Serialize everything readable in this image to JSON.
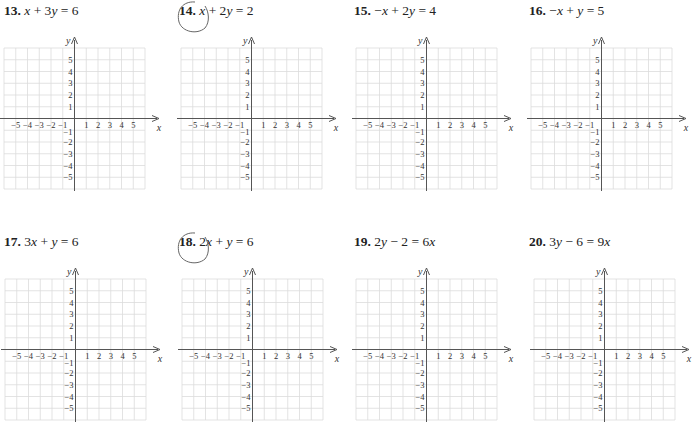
{
  "worksheet": {
    "problems": [
      {
        "number": "13.",
        "equation": "x + 3y = 6",
        "circled": false
      },
      {
        "number": "14.",
        "equation": "x + 2y = 2",
        "circled": true
      },
      {
        "number": "15.",
        "equation": "−x + 2y = 4",
        "circled": false
      },
      {
        "number": "16.",
        "equation": "−x + y = 5",
        "circled": false
      },
      {
        "number": "17.",
        "equation": "3x + y = 6",
        "circled": false
      },
      {
        "number": "18.",
        "equation": "2x + y = 6",
        "circled": true
      },
      {
        "number": "19.",
        "equation": "2y − 2 = 6x",
        "circled": false
      },
      {
        "number": "20.",
        "equation": "3y − 6 = 9x",
        "circled": false
      }
    ],
    "axes": {
      "x_label": "x",
      "y_label": "y",
      "x_ticks": [
        "−5",
        "−4",
        "−3",
        "−2",
        "−1",
        "1",
        "2",
        "3",
        "4",
        "5"
      ],
      "y_ticks": [
        "5",
        "4",
        "3",
        "2",
        "1",
        "−1",
        "−2",
        "−3",
        "−4",
        "−5"
      ],
      "range": [
        -6,
        6
      ]
    },
    "colors": {
      "grid": "#dcdcdc",
      "axis": "#555555",
      "text": "#222222",
      "pencil": "#666666"
    }
  }
}
